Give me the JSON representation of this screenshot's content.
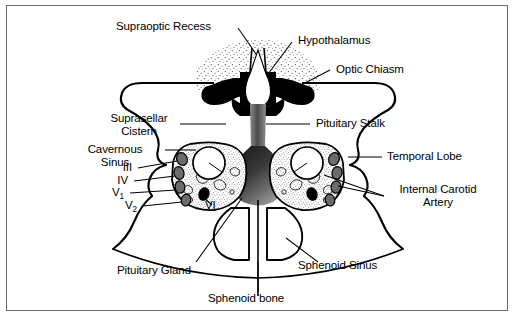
{
  "figure": {
    "border_color": "#6a6a6a",
    "background": "#ffffff",
    "line_color": "#000000"
  },
  "labels": {
    "supraoptic_recess": "Supraoptic Recess",
    "hypothalamus": "Hypothalamus",
    "optic_chiasm": "Optic Chiasm",
    "suprasellar_cistern_line1": "Suprasellar",
    "suprasellar_cistern_line2": "Cistern",
    "pituitary_stalk": "Pituitary Stalk",
    "cavernous_sinus_line1": "Cavernous",
    "cavernous_sinus_line2": "Sinus",
    "temporal_lobe": "Temporal Lobe",
    "internal_carotid_line1": "Internal Carotid",
    "internal_carotid_line2": "Artery",
    "pituitary_gland": "Pituitary Gland",
    "sphenoid_sinus": "Sphenoid Sinus",
    "sphenoid_bone": "Sphenoid bone"
  },
  "cranial_nerves": {
    "cn3": "III",
    "cn4": "IV",
    "cn5_1_base": "V",
    "cn5_1_sub": "1",
    "cn5_2_base": "V",
    "cn5_2_sub": "2",
    "cn6": "VI"
  },
  "structures": {
    "optic_chiasm_fill": "#000000",
    "supraoptic_recess_fill": "#ffffff",
    "hypothalamus_texture": "stipple",
    "pituitary_gland_fill": "gradient-dark-to-light",
    "cavernous_sinus_fill": "stipple",
    "carotid_fill": "#ffffff",
    "nerve_fill": "#6b6b6b",
    "cn6_fill": "#000000",
    "sphenoid_sinus_fill": "#ffffff"
  }
}
